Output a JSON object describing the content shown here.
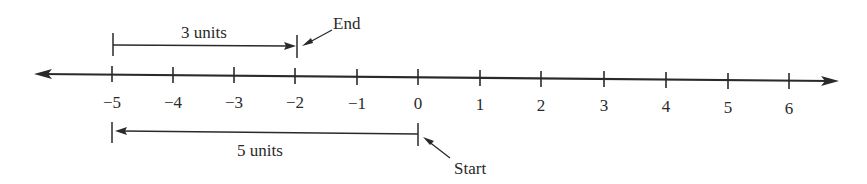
{
  "diagram": {
    "type": "number-line",
    "axis": {
      "min_visible": -5,
      "max_visible": 6,
      "ticks": [
        {
          "value": -5,
          "label": "−5",
          "x": 112
        },
        {
          "value": -4,
          "label": "−4",
          "x": 173
        },
        {
          "value": -3,
          "label": "−3",
          "x": 234
        },
        {
          "value": -2,
          "label": "−2",
          "x": 295
        },
        {
          "value": -1,
          "label": "−1",
          "x": 357
        },
        {
          "value": 0,
          "label": "0",
          "x": 418
        },
        {
          "value": 1,
          "label": "1",
          "x": 480
        },
        {
          "value": 2,
          "label": "2",
          "x": 541
        },
        {
          "value": 3,
          "label": "3",
          "x": 604
        },
        {
          "value": 4,
          "label": "4",
          "x": 666
        },
        {
          "value": 5,
          "label": "5",
          "x": 728
        },
        {
          "value": 6,
          "label": "6",
          "x": 789
        }
      ],
      "arrows": [
        "left",
        "right"
      ]
    },
    "upper_bracket": {
      "label": "3 units",
      "from": -5,
      "to": -2,
      "arrow_direction": "right"
    },
    "lower_bracket": {
      "label": "5 units",
      "from": 0,
      "to": -5,
      "arrow_direction": "left"
    },
    "annotations": {
      "end": {
        "label": "End",
        "points_to": -2
      },
      "start": {
        "label": "Start",
        "points_to": 0
      }
    },
    "colors": {
      "ink": "#2a2a2a",
      "background": "#ffffff"
    }
  }
}
